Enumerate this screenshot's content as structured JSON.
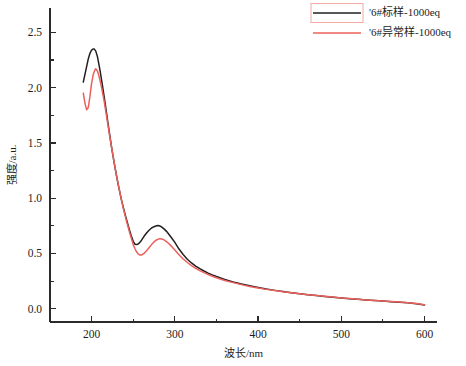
{
  "chart_data": {
    "type": "line",
    "title": "",
    "xlabel": "波长/nm",
    "ylabel": "强度/a.u.",
    "xlim": [
      150,
      615
    ],
    "ylim": [
      -0.12,
      2.72
    ],
    "grid": false,
    "legend_position": "top-right",
    "xticks": [
      200,
      300,
      400,
      500,
      600
    ],
    "xtick_labels": [
      "200",
      "300",
      "400",
      "500",
      "600"
    ],
    "xminor_ticks": [
      150,
      250,
      350,
      450,
      550
    ],
    "yticks": [
      0.0,
      0.5,
      1.0,
      1.5,
      2.0,
      2.5
    ],
    "ytick_labels": [
      "0.0",
      "0.5",
      "1.0",
      "1.5",
      "2.0",
      "2.5"
    ],
    "yminor_ticks": [
      0.25,
      0.75,
      1.25,
      1.75,
      2.25
    ],
    "series": [
      {
        "name": "'6#标样-1000eq",
        "color": "#231f20",
        "width": 1.5,
        "x": [
          190,
          192,
          194,
          196,
          198,
          200,
          202,
          203,
          205,
          207,
          210,
          213,
          216,
          220,
          224,
          228,
          232,
          236,
          240,
          244,
          248,
          250,
          252,
          254,
          256,
          258,
          260,
          263,
          266,
          269,
          272,
          275,
          278,
          280,
          282,
          284,
          287,
          290,
          293,
          296,
          300,
          305,
          310,
          315,
          320,
          325,
          330,
          335,
          340,
          345,
          350,
          360,
          370,
          380,
          390,
          400,
          410,
          420,
          430,
          440,
          450,
          460,
          470,
          480,
          490,
          500,
          510,
          520,
          530,
          540,
          550,
          560,
          570,
          580,
          590,
          600
        ],
        "y": [
          2.05,
          2.12,
          2.19,
          2.26,
          2.31,
          2.34,
          2.35,
          2.35,
          2.33,
          2.28,
          2.16,
          2.02,
          1.87,
          1.66,
          1.46,
          1.28,
          1.12,
          0.98,
          0.86,
          0.75,
          0.65,
          0.61,
          0.585,
          0.58,
          0.585,
          0.6,
          0.62,
          0.655,
          0.685,
          0.71,
          0.73,
          0.742,
          0.75,
          0.752,
          0.748,
          0.74,
          0.722,
          0.7,
          0.672,
          0.642,
          0.6,
          0.54,
          0.49,
          0.448,
          0.414,
          0.386,
          0.362,
          0.341,
          0.322,
          0.306,
          0.291,
          0.265,
          0.243,
          0.224,
          0.207,
          0.192,
          0.178,
          0.166,
          0.155,
          0.145,
          0.136,
          0.127,
          0.119,
          0.111,
          0.104,
          0.097,
          0.091,
          0.085,
          0.079,
          0.074,
          0.069,
          0.064,
          0.059,
          0.053,
          0.046,
          0.034
        ]
      },
      {
        "name": "'6#异常样-1000eq",
        "color": "#ec605b",
        "width": 1.5,
        "x": [
          190,
          192,
          194,
          196,
          198,
          200,
          202,
          204,
          205,
          207,
          209,
          212,
          215,
          218,
          222,
          226,
          230,
          234,
          238,
          242,
          246,
          250,
          252,
          254,
          256,
          258,
          260,
          263,
          266,
          269,
          272,
          275,
          278,
          281,
          283,
          285,
          288,
          291,
          294,
          297,
          300,
          305,
          310,
          315,
          320,
          325,
          330,
          335,
          340,
          345,
          350,
          360,
          370,
          380,
          390,
          400,
          410,
          420,
          430,
          440,
          450,
          460,
          470,
          480,
          490,
          500,
          510,
          520,
          530,
          540,
          550,
          560,
          570,
          580,
          590,
          600
        ],
        "y": [
          1.95,
          1.86,
          1.8,
          1.82,
          1.92,
          2.04,
          2.12,
          2.16,
          2.17,
          2.15,
          2.1,
          2.0,
          1.88,
          1.74,
          1.55,
          1.37,
          1.2,
          1.05,
          0.91,
          0.79,
          0.68,
          0.58,
          0.545,
          0.515,
          0.495,
          0.485,
          0.485,
          0.5,
          0.525,
          0.552,
          0.58,
          0.604,
          0.622,
          0.632,
          0.633,
          0.629,
          0.618,
          0.601,
          0.58,
          0.557,
          0.532,
          0.488,
          0.45,
          0.418,
          0.39,
          0.366,
          0.345,
          0.326,
          0.309,
          0.294,
          0.28,
          0.256,
          0.236,
          0.218,
          0.202,
          0.188,
          0.175,
          0.164,
          0.153,
          0.144,
          0.135,
          0.127,
          0.119,
          0.112,
          0.105,
          0.098,
          0.092,
          0.086,
          0.08,
          0.075,
          0.07,
          0.065,
          0.06,
          0.055,
          0.048,
          0.036
        ]
      }
    ],
    "legend": [
      {
        "label": "'6#标样-1000eq",
        "color": "#231f20",
        "boxed": true
      },
      {
        "label": "'6#异常样-1000eq",
        "color": "#ec605b",
        "boxed": false
      }
    ]
  }
}
